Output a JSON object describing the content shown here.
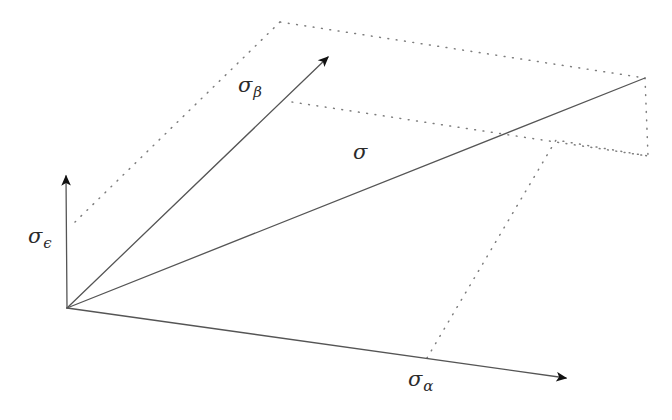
{
  "figure": {
    "background_color": "#ffffff",
    "solid_line_color": "#555555",
    "dotted_line_color": "#777777",
    "label_color": "#2b2b2b"
  },
  "labels": {
    "sigma_beta": {
      "base": "σ",
      "sub": "β"
    },
    "sigma": {
      "base": "σ",
      "sub": ""
    },
    "sigma_epsilon": {
      "base": "σ",
      "sub": "ϵ"
    },
    "sigma_alpha": {
      "base": "σ",
      "sub": "α"
    }
  },
  "geometry": {
    "origin": {
      "x": 67,
      "y": 308
    },
    "vectors": [
      {
        "name": "sigma-epsilon-vector",
        "label": "σϵ",
        "from": [
          67,
          308
        ],
        "to": [
          66,
          160
        ],
        "arrowhead": true
      },
      {
        "name": "sigma-beta-vector",
        "label": "σβ",
        "from": [
          67,
          308
        ],
        "to": [
          339,
          45
        ],
        "arrowhead": true
      },
      {
        "name": "sigma-resultant-vector",
        "label": "σ",
        "from": [
          67,
          308
        ],
        "to": [
          645,
          78
        ],
        "arrowhead": false
      },
      {
        "name": "sigma-alpha-vector",
        "label": "σα",
        "from": [
          67,
          308
        ],
        "to": [
          578,
          380
        ],
        "arrowhead": true
      }
    ],
    "construction_lines": [
      {
        "name": "dotted-eps-to-beta-top",
        "points": [
          [
            75,
            222
          ],
          [
            280,
            22
          ]
        ]
      },
      {
        "name": "dotted-beta-top-to-far-corner",
        "points": [
          [
            280,
            22
          ],
          [
            645,
            78
          ]
        ]
      },
      {
        "name": "dotted-beta-tip-to-mid-corner",
        "points": [
          [
            292,
            102
          ],
          [
            648,
            156
          ]
        ]
      },
      {
        "name": "dotted-far-corner-vertical",
        "points": [
          [
            645,
            78
          ],
          [
            648,
            156
          ]
        ]
      },
      {
        "name": "dotted-alpha-base-to-mid-corner",
        "points": [
          [
            427,
            358
          ],
          [
            556,
            140
          ],
          [
            648,
            156
          ]
        ]
      }
    ]
  }
}
